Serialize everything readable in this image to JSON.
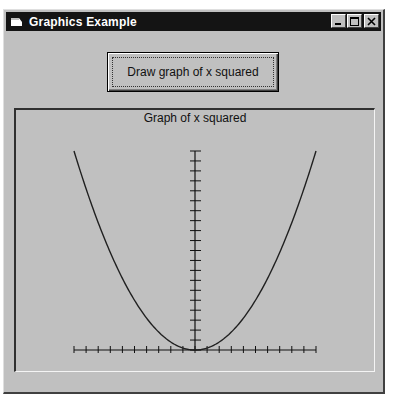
{
  "window": {
    "title": "Graphics Example",
    "icon": "app-window-icon",
    "controls": [
      "minimize-icon",
      "maximize-icon",
      "close-icon"
    ]
  },
  "toolbar": {
    "draw_label": "Draw graph of x squared"
  },
  "graph": {
    "title": "Graph of x squared",
    "line_color": "#202020",
    "axis_color": "#101010"
  },
  "chart_data": {
    "type": "line",
    "title": "Graph of x squared",
    "xlabel": "",
    "ylabel": "",
    "x": [
      -10,
      -9,
      -8,
      -7,
      -6,
      -5,
      -4,
      -3,
      -2,
      -1,
      0,
      1,
      2,
      3,
      4,
      5,
      6,
      7,
      8,
      9,
      10
    ],
    "series": [
      {
        "name": "y = x^2",
        "values": [
          100,
          81,
          64,
          49,
          36,
          25,
          16,
          9,
          4,
          1,
          0,
          1,
          4,
          9,
          16,
          25,
          36,
          49,
          64,
          81,
          100
        ]
      }
    ],
    "xlim": [
      -10,
      10
    ],
    "ylim": [
      0,
      100
    ],
    "x_ticks": 21,
    "y_ticks": 21,
    "grid": false,
    "legend": "none"
  }
}
